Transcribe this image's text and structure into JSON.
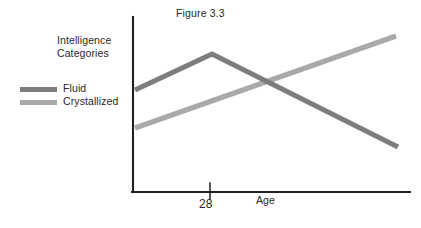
{
  "figure": {
    "title": "Figure 3.3",
    "category_label_line1": "Intelligence",
    "category_label_line2": "Categories",
    "x_axis_title": "Age",
    "x_tick_label": "28"
  },
  "legend": {
    "items": [
      {
        "label": "Fluid",
        "color": "#7d7d7d"
      },
      {
        "label": "Crystallized",
        "color": "#a9a9a9"
      }
    ]
  },
  "colors": {
    "axis": "#231f20",
    "fluid": "#7d7d7d",
    "crystallized": "#a9a9a9",
    "text": "#2a2728",
    "background": "#ffffff"
  },
  "chart_data": {
    "type": "line",
    "title": "Figure 3.3",
    "xlabel": "Age",
    "ylabel": "Intelligence Categories",
    "grid": false,
    "legend_position": "left-outside",
    "x_ticks": [
      {
        "label": "28",
        "pixel_x": 210
      }
    ],
    "axis_pixels": {
      "y_axis_x": 133,
      "y_axis_top": 17,
      "y_axis_bottom": 192,
      "x_axis_y": 192,
      "x_axis_left": 133,
      "x_axis_right": 410
    },
    "crossing_point_pixels": {
      "x": 272,
      "y": 84
    },
    "series": [
      {
        "name": "Fluid",
        "color": "#7d7d7d",
        "description": "Rises to a peak at age 28 then declines steadily",
        "points_pixels": [
          {
            "x": 135,
            "y": 90
          },
          {
            "x": 212,
            "y": 54
          },
          {
            "x": 398,
            "y": 147
          }
        ],
        "values": [
          {
            "x": "young",
            "y": 58
          },
          {
            "x": "28",
            "y": 79
          },
          {
            "x": "old",
            "y": 26
          }
        ]
      },
      {
        "name": "Crystallized",
        "color": "#a9a9a9",
        "description": "Rises steadily and linearly across the lifespan",
        "points_pixels": [
          {
            "x": 135,
            "y": 128
          },
          {
            "x": 396,
            "y": 36
          }
        ],
        "values": [
          {
            "x": "young",
            "y": 37
          },
          {
            "x": "old",
            "y": 89
          }
        ]
      }
    ]
  }
}
